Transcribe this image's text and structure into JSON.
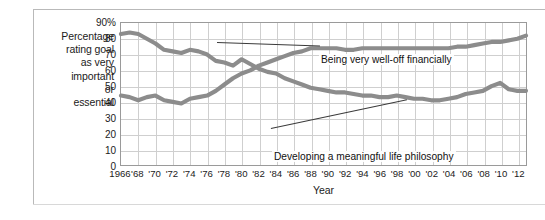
{
  "figure": {
    "y_axis_caption_lines": [
      "Percentage",
      "rating goal",
      "as very",
      "important",
      "or",
      "essential"
    ],
    "x_axis_title": "Year",
    "line_color": "#8c8c8c",
    "grid_color": "#cfcfcf",
    "axis_color": "#9a9a9a"
  },
  "chart_data": {
    "type": "line",
    "title": "",
    "subtitle": "",
    "xlabel": "Year",
    "ylabel": "Percentage rating goal as very important or essential",
    "ylim": [
      0,
      90
    ],
    "xlim": [
      1966,
      2013
    ],
    "grid": true,
    "legend_position": "inline-annotations",
    "ytick_labels": [
      "90%",
      "80",
      "70",
      "60",
      "50",
      "40",
      "30",
      "20",
      "10",
      "0"
    ],
    "ytick_values": [
      90,
      80,
      70,
      60,
      50,
      40,
      30,
      20,
      10,
      0
    ],
    "xtick_labels": [
      "1966",
      "'68",
      "'70",
      "'72",
      "'74",
      "'76",
      "'78",
      "'80",
      "'82",
      "'84",
      "'86",
      "'88",
      "'90",
      "'92",
      "'94",
      "'96",
      "'98",
      "'00",
      "'02",
      "'04",
      "'06",
      "'08",
      "'10",
      "'12"
    ],
    "xtick_values": [
      1966,
      1968,
      1970,
      1972,
      1974,
      1976,
      1978,
      1980,
      1982,
      1984,
      1986,
      1988,
      1990,
      1992,
      1994,
      1996,
      1998,
      2000,
      2002,
      2004,
      2006,
      2008,
      2010,
      2012
    ],
    "x": [
      1966,
      1967,
      1968,
      1969,
      1970,
      1971,
      1972,
      1973,
      1974,
      1975,
      1976,
      1977,
      1978,
      1979,
      1980,
      1981,
      1982,
      1983,
      1984,
      1985,
      1986,
      1987,
      1988,
      1989,
      1990,
      1991,
      1992,
      1993,
      1994,
      1995,
      1996,
      1997,
      1998,
      1999,
      2000,
      2001,
      2002,
      2003,
      2004,
      2005,
      2006,
      2007,
      2008,
      2009,
      2010,
      2011,
      2012,
      2013
    ],
    "series": [
      {
        "name": "Developing a meaningful life philosophy",
        "annotation": "Developing a meaningful life philosophy",
        "color": "#8c8c8c",
        "values": [
          83,
          84,
          83,
          80,
          77,
          73,
          72,
          71,
          73,
          72,
          70,
          66,
          65,
          63,
          67,
          64,
          61,
          59,
          58,
          55,
          53,
          51,
          49,
          48,
          47,
          46,
          46,
          45,
          44,
          44,
          43,
          43,
          44,
          43,
          42,
          42,
          41,
          41,
          42,
          43,
          45,
          46,
          47,
          50,
          52,
          48,
          47,
          47
        ]
      },
      {
        "name": "Being very well-off financially",
        "annotation": "Being very well-off financially",
        "color": "#8c8c8c",
        "values": [
          44,
          43,
          41,
          43,
          44,
          41,
          40,
          39,
          42,
          43,
          44,
          47,
          51,
          55,
          58,
          60,
          63,
          65,
          67,
          69,
          71,
          72,
          74,
          74,
          74,
          74,
          73,
          73,
          74,
          74,
          74,
          74,
          74,
          74,
          74,
          74,
          74,
          74,
          74,
          75,
          75,
          76,
          77,
          78,
          78,
          79,
          80,
          82
        ]
      }
    ],
    "annotations": [
      {
        "text": "Being very well-off financially",
        "points_to_series": "Being very well-off financially",
        "points_to_x": 1989
      },
      {
        "text": "Developing a meaningful life philosophy",
        "points_to_series": "Developing a meaningful life philosophy",
        "points_to_x": 1999
      }
    ]
  }
}
